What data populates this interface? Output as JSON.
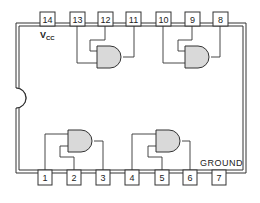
{
  "diagram": {
    "type": "IC pinout",
    "package": "14-pin DIP",
    "gate_type": "2-input AND",
    "gate_fill": "#d9d9d9",
    "line_color": "#333333",
    "labels": {
      "vcc_main": "V",
      "vcc_sub": "CC",
      "ground": "GROUND"
    },
    "top_pins": [
      {
        "number": "14",
        "x": 47
      },
      {
        "number": "13",
        "x": 77
      },
      {
        "number": "12",
        "x": 105
      },
      {
        "number": "11",
        "x": 134
      },
      {
        "number": "10",
        "x": 163
      },
      {
        "number": "9",
        "x": 192
      },
      {
        "number": "8",
        "x": 220
      }
    ],
    "bottom_pins": [
      {
        "number": "1",
        "x": 45
      },
      {
        "number": "2",
        "x": 74
      },
      {
        "number": "3",
        "x": 103
      },
      {
        "number": "4",
        "x": 132
      },
      {
        "number": "5",
        "x": 162
      },
      {
        "number": "6",
        "x": 190
      },
      {
        "number": "7",
        "x": 219
      }
    ],
    "gates": [
      {
        "id": "gate-1",
        "inputs": [
          "13",
          "12"
        ],
        "output": "11"
      },
      {
        "id": "gate-2",
        "inputs": [
          "10",
          "9"
        ],
        "output": "8"
      },
      {
        "id": "gate-3",
        "inputs": [
          "1",
          "2"
        ],
        "output": "3"
      },
      {
        "id": "gate-4",
        "inputs": [
          "4",
          "5"
        ],
        "output": "6"
      }
    ]
  }
}
